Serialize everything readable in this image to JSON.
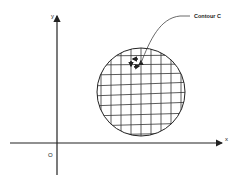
{
  "diagram": {
    "labels": {
      "y_axis": "y",
      "x_axis": "x",
      "origin": "O",
      "contour": "Contour C"
    },
    "colors": {
      "line": "#222222",
      "grid": "#333333",
      "background": "#ffffff"
    },
    "region": {
      "shape": "circle",
      "fill": "grid",
      "center": [
        141,
        92
      ],
      "radius": 44,
      "grid_spacing": 10
    },
    "small_contour": {
      "description": "small rectangular circulation with arrows inside a grid cell",
      "arrows": 4
    }
  }
}
